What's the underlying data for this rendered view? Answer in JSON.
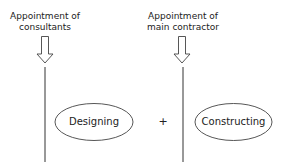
{
  "diagram": {
    "left": {
      "label_line1": "Appointment of",
      "label_line2": "consultants",
      "phase": "Designing"
    },
    "right": {
      "label_line1": "Appointment of",
      "label_line2": "main contractor",
      "phase": "Constructing"
    },
    "operator": "+",
    "colors": {
      "stroke": "#333333",
      "text": "#222222",
      "background": "#ffffff"
    }
  }
}
